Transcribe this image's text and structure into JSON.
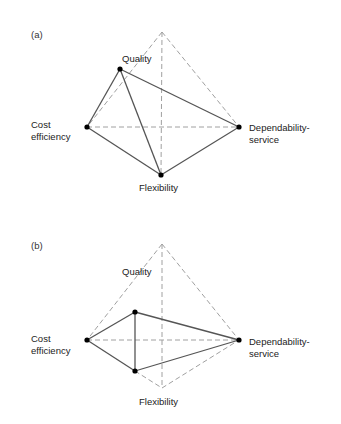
{
  "panels": [
    {
      "id": "a",
      "label": "(a)",
      "axes": {
        "quality": "Quality",
        "cost_line1": "Cost",
        "cost_line2": "efficiency",
        "dep_line1": "Dependability-",
        "dep_line2": "service",
        "flexibility": "Flexibility"
      },
      "frame": {
        "top": [
          162,
          32
        ],
        "left": [
          87,
          127
        ],
        "right": [
          239,
          127
        ],
        "bottom": [
          161,
          175
        ]
      },
      "points": {
        "quality": [
          120,
          69
        ],
        "cost": [
          87,
          127
        ],
        "dependability": [
          239,
          127
        ],
        "flexibility": [
          161,
          175
        ]
      }
    },
    {
      "id": "b",
      "label": "(b)",
      "axes": {
        "quality": "Quality",
        "cost_line1": "Cost",
        "cost_line2": "efficiency",
        "dep_line1": "Dependability-",
        "dep_line2": "service",
        "flexibility": "Flexibility"
      },
      "frame": {
        "top": [
          162,
          244
        ],
        "left": [
          87,
          340
        ],
        "right": [
          239,
          340
        ],
        "bottom": [
          162,
          388
        ]
      },
      "points": {
        "quality": [
          135,
          312
        ],
        "cost": [
          87,
          340
        ],
        "dependability": [
          239,
          340
        ],
        "flexibility": [
          135,
          371
        ]
      }
    }
  ],
  "colors": {
    "frame_dashed": "#a0a0a0",
    "profile_line": "#555555",
    "point": "#000000"
  }
}
